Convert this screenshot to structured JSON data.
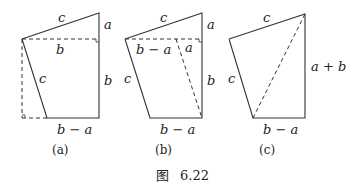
{
  "figure": {
    "caption_prefix": "图",
    "caption_number": "6.22",
    "panels": [
      {
        "id": "a",
        "label": "(a)",
        "edge_labels": {
          "top": "c",
          "right_upper": "a",
          "dashed_horizontal": "b",
          "left_slanted": "c",
          "right_lower": "b",
          "bottom": "b − a"
        }
      },
      {
        "id": "b",
        "label": "(b)",
        "edge_labels": {
          "top": "c",
          "right_upper": "a",
          "dashed_left_segment": "b − a",
          "dashed_right_segment": "a",
          "left_slanted": "c",
          "right_lower": "b",
          "bottom": "b − a"
        }
      },
      {
        "id": "c",
        "label": "(c)",
        "edge_labels": {
          "top": "c",
          "right": "a + b",
          "left_slanted": "c",
          "bottom": "b − a"
        }
      }
    ]
  }
}
